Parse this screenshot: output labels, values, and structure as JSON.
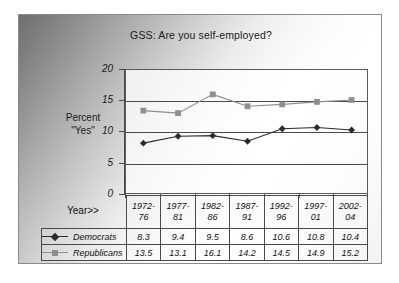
{
  "chart_data": {
    "type": "line",
    "title": "GSS: Are you self-employed?",
    "xlabel": "Year>>",
    "ylabel": "Percent \"Yes\"",
    "ylabel_lines": [
      "Percent",
      "\"Yes\""
    ],
    "categories": [
      "1972-76",
      "1977-81",
      "1982-86",
      "1987-91",
      "1992-96",
      "1997-01",
      "2002-04"
    ],
    "category_lines": [
      [
        "1972-",
        "76"
      ],
      [
        "1977-",
        "81"
      ],
      [
        "1982-",
        "86"
      ],
      [
        "1987-",
        "91"
      ],
      [
        "1992-",
        "96"
      ],
      [
        "1997-",
        "01"
      ],
      [
        "2002-",
        "04"
      ]
    ],
    "series": [
      {
        "name": "Democrats",
        "marker": "diamond",
        "color": "#2b2b2b",
        "values": [
          8.3,
          9.4,
          9.5,
          8.6,
          10.6,
          10.8,
          10.4
        ]
      },
      {
        "name": "Republicans",
        "marker": "square",
        "color": "#8f8f8f",
        "values": [
          13.5,
          13.1,
          16.1,
          14.2,
          14.5,
          14.9,
          15.2
        ]
      }
    ],
    "ylim": [
      0,
      20
    ],
    "yticks": [
      0,
      5,
      10,
      15,
      20
    ],
    "ytick_labels": [
      "0",
      "5",
      "10",
      "15",
      "20"
    ],
    "grid": true,
    "legend_position": "data-table-left",
    "data_table_visible": true
  },
  "colors": {
    "democrats": "#2b2b2b",
    "republicans": "#8f8f8f",
    "axis": "#4a4a4a",
    "frame": "#8a8a8a",
    "text": "#1a1a1a"
  }
}
